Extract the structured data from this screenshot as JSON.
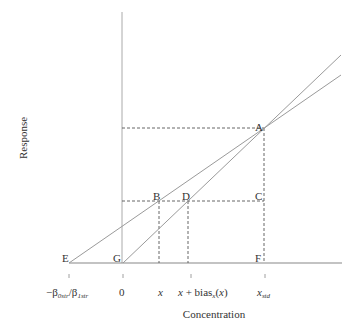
{
  "diagram": {
    "y_axis_label": "Response",
    "x_axis_label": "Concentration",
    "points": {
      "A": "A",
      "B": "B",
      "C": "C",
      "D": "D",
      "E": "E",
      "F": "F",
      "G": "G"
    },
    "x_ticks": {
      "intercept": {
        "minus": "−β",
        "sub1": "0str",
        "slash": "/β",
        "sub2": "1str"
      },
      "zero": "0",
      "x": "x",
      "x_bias": {
        "x": "x",
        "plus": " + bias",
        "sub": "x",
        "arg_open": "(",
        "arg": "x",
        "arg_close": ")"
      },
      "x_std": {
        "x": "x",
        "sub": "std"
      }
    },
    "colors": {
      "lines": "#9a9a9a",
      "dashed": "#555555",
      "axis": "#999999",
      "text": "#333333"
    }
  }
}
